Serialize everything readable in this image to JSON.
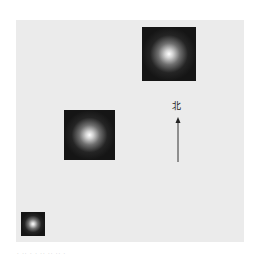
{
  "figure": {
    "background_color": "#ebebeb",
    "north_label": "北",
    "caption": "· ·· · ·  ·· ·· ·· ·",
    "squares": [
      {
        "id": "large-top-right",
        "x": 142,
        "y": 27,
        "size": 54
      },
      {
        "id": "medium-center-left",
        "x": 64,
        "y": 110,
        "size": 51
      },
      {
        "id": "small-bottom-left",
        "x": 21,
        "y": 212,
        "size": 24
      }
    ],
    "arrow": {
      "x": 178,
      "y_top": 118,
      "y_bottom": 161,
      "color": "#333333"
    }
  }
}
